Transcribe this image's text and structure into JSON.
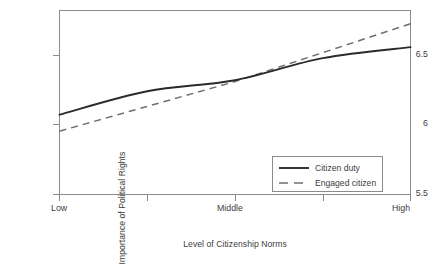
{
  "chart_data": {
    "type": "line",
    "title": "",
    "xlabel": "Level of Citizenship Norms",
    "ylabel": "Importance of Political Rights",
    "x": [
      0,
      1,
      2,
      3,
      4
    ],
    "x_tick_labels": [
      "Low",
      "",
      "Middle",
      "",
      "High"
    ],
    "x_labeled_ticks": [
      "Low",
      "Middle",
      "High"
    ],
    "y_tick_labels": [
      "5.5",
      "6",
      "6.5"
    ],
    "y_ticks": [
      5.5,
      6.0,
      6.5
    ],
    "ylim": [
      5.43,
      6.77
    ],
    "xlim": [
      0,
      4
    ],
    "grid": false,
    "legend_position": "lower right",
    "series": [
      {
        "name": "Citizen duty",
        "style": "solid",
        "color": "#2b2b2b",
        "values": [
          6.01,
          6.18,
          6.26,
          6.42,
          6.5
        ]
      },
      {
        "name": "Engaged citizen",
        "style": "dashed",
        "color": "#6f6f6f",
        "values": [
          5.89,
          6.07,
          6.25,
          6.46,
          6.67
        ]
      }
    ],
    "annotations": []
  },
  "axes": {
    "y_title": "Importance of Political Rights",
    "x_title": "Level of Citizenship Norms",
    "y_ticks": [
      {
        "label": "6.5",
        "value": 6.5
      },
      {
        "label": "6",
        "value": 6.0
      },
      {
        "label": "5.5",
        "value": 5.5
      }
    ],
    "x_ticks": [
      {
        "label": "Low",
        "value": 0
      },
      {
        "label": "",
        "value": 1
      },
      {
        "label": "Middle",
        "value": 2
      },
      {
        "label": "",
        "value": 3
      },
      {
        "label": "High",
        "value": 4
      }
    ]
  },
  "legend": {
    "entries": [
      {
        "label": "Citizen duty",
        "style": "solid"
      },
      {
        "label": "Engaged citizen",
        "style": "dashed"
      }
    ]
  },
  "colors": {
    "series_solid": "#2b2b2b",
    "series_dashed": "#6f6f6f",
    "axis": "#8b8b8b",
    "text": "#3d3d3d",
    "background": "#ffffff"
  }
}
